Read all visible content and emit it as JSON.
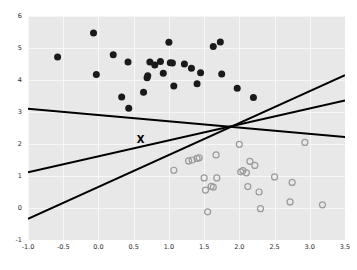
{
  "chart_data": {
    "type": "scatter",
    "title": "",
    "xlabel": "",
    "ylabel": "",
    "xlim": [
      -1.0,
      3.5
    ],
    "ylim": [
      -1,
      6
    ],
    "grid": true,
    "legend": "none",
    "background": "#e8e8e8",
    "xticks": [
      "-1.0",
      "-0.5",
      "0.0",
      "0.5",
      "1.0",
      "1.5",
      "2.0",
      "2.5",
      "3.0",
      "3.5"
    ],
    "xtick_values": [
      -1.0,
      -0.5,
      0.0,
      0.5,
      1.0,
      1.5,
      2.0,
      2.5,
      3.0,
      3.5
    ],
    "yticks": [
      "-1",
      "0",
      "1",
      "2",
      "3",
      "4",
      "5",
      "6"
    ],
    "ytick_values": [
      -1,
      0,
      1,
      2,
      3,
      4,
      5,
      6
    ],
    "series": [
      {
        "name": "class-a-filled",
        "marker": "filled-circle",
        "color": "#1a1a1a",
        "size": 4.2,
        "points": [
          [
            -0.58,
            4.72
          ],
          [
            -0.07,
            5.47
          ],
          [
            -0.03,
            4.17
          ],
          [
            0.21,
            4.79
          ],
          [
            0.33,
            3.47
          ],
          [
            0.42,
            4.56
          ],
          [
            0.43,
            3.12
          ],
          [
            0.64,
            3.62
          ],
          [
            0.69,
            4.07
          ],
          [
            0.7,
            4.13
          ],
          [
            0.73,
            4.56
          ],
          [
            0.8,
            4.47
          ],
          [
            0.88,
            4.58
          ],
          [
            0.92,
            4.21
          ],
          [
            1.0,
            5.18
          ],
          [
            1.02,
            4.54
          ],
          [
            1.05,
            4.53
          ],
          [
            1.07,
            3.81
          ],
          [
            1.22,
            4.5
          ],
          [
            1.32,
            4.37
          ],
          [
            1.4,
            3.88
          ],
          [
            1.45,
            4.23
          ],
          [
            1.63,
            5.05
          ],
          [
            1.73,
            5.19
          ],
          [
            1.75,
            4.19
          ],
          [
            1.97,
            3.74
          ],
          [
            2.2,
            3.45
          ]
        ]
      },
      {
        "name": "class-b-open",
        "marker": "open-circle",
        "color": "#9a9a9a",
        "size": 4.2,
        "points": [
          [
            1.07,
            1.18
          ],
          [
            1.28,
            1.47
          ],
          [
            1.33,
            1.5
          ],
          [
            1.4,
            1.55
          ],
          [
            1.43,
            1.57
          ],
          [
            1.5,
            0.94
          ],
          [
            1.52,
            0.56
          ],
          [
            1.55,
            -0.12
          ],
          [
            1.6,
            0.68
          ],
          [
            1.63,
            0.65
          ],
          [
            1.67,
            1.66
          ],
          [
            1.68,
            0.94
          ],
          [
            2.0,
            1.99
          ],
          [
            2.02,
            1.13
          ],
          [
            2.05,
            1.17
          ],
          [
            2.1,
            1.1
          ],
          [
            2.12,
            0.67
          ],
          [
            2.15,
            1.46
          ],
          [
            2.22,
            1.33
          ],
          [
            2.28,
            0.5
          ],
          [
            2.3,
            -0.02
          ],
          [
            2.5,
            0.97
          ],
          [
            2.72,
            0.19
          ],
          [
            2.75,
            0.8
          ],
          [
            2.93,
            2.05
          ],
          [
            3.18,
            0.1
          ]
        ]
      }
    ],
    "markers": [
      {
        "name": "query-point-x",
        "marker": "x",
        "color": "#000000",
        "x": 0.6,
        "y": 2.13,
        "label": "X"
      }
    ],
    "lines": [
      {
        "name": "boundary-descending",
        "color": "#000000",
        "width": 2.0,
        "x1": -1.0,
        "y1": 3.1,
        "x2": 3.5,
        "y2": 2.22
      },
      {
        "name": "boundary-shallow-ascending",
        "color": "#000000",
        "width": 2.0,
        "x1": -1.0,
        "y1": 1.12,
        "x2": 3.5,
        "y2": 3.36
      },
      {
        "name": "boundary-steep-ascending",
        "color": "#000000",
        "width": 2.0,
        "x1": -1.0,
        "y1": -0.34,
        "x2": 3.5,
        "y2": 4.15
      }
    ],
    "intersection": {
      "x": 1.82,
      "y": 2.55
    }
  }
}
